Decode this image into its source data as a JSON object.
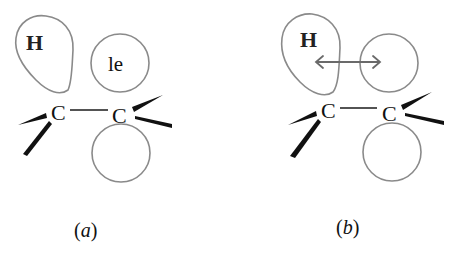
{
  "figure": {
    "colors": {
      "orbital_stroke": "#8a8a8a",
      "ink": "#111111",
      "arrow": "#6a6a6a",
      "background": "#ffffff"
    },
    "panels": [
      {
        "id": "a",
        "caption_open": "(",
        "caption_letter": "a",
        "caption_close": ")",
        "atoms": {
          "left_carbon": "C",
          "right_carbon": "C",
          "hydrogen": "H"
        },
        "upper_orbital_label": "le",
        "lower_orbital_label": "",
        "has_arrow": false
      },
      {
        "id": "b",
        "caption_open": "(",
        "caption_letter": "b",
        "caption_close": ")",
        "atoms": {
          "left_carbon": "C",
          "right_carbon": "C",
          "hydrogen": "H"
        },
        "upper_orbital_label": "",
        "lower_orbital_label": "",
        "has_arrow": true,
        "arrow_type": "double-headed"
      }
    ]
  }
}
